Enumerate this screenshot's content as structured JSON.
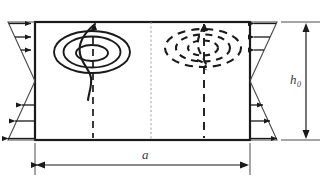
{
  "figure": {
    "type": "technical-diagram",
    "background_color": "#ffffff",
    "stroke_color": "#1a1a1a",
    "thin_stroke_color": "#4a4a4a",
    "centerline_color": "#9a9a9a"
  },
  "labels": {
    "width_label": "a",
    "height_label": "h",
    "height_subscript": "0"
  },
  "dimensions": {
    "width_dimension_name": "a",
    "height_dimension_name": "h0"
  },
  "box": {
    "name": "channel-cross-section",
    "x": 35,
    "y": 22,
    "width": 215,
    "height": 118
  },
  "vortices": [
    {
      "name": "left-vortex",
      "style": "solid",
      "center_x": 92,
      "center_y": 52,
      "rings": 3,
      "axis": "dashed-vertical"
    },
    {
      "name": "right-vortex",
      "style": "dashed",
      "center_x": 203,
      "center_y": 48,
      "rings": 3,
      "axis": "dashed-vertical"
    }
  ],
  "velocity_profiles": {
    "left": {
      "name": "left-velocity-profile",
      "upper_arrow_direction": "right",
      "lower_arrow_direction": "left",
      "arrow_count": 6,
      "zero_crossing_fraction": 0.5
    },
    "right": {
      "name": "right-velocity-profile",
      "upper_arrow_direction": "left",
      "lower_arrow_direction": "right",
      "arrow_count": 6,
      "zero_crossing_fraction": 0.5
    }
  },
  "centerline": {
    "name": "vertical-centerline",
    "x": 151,
    "style": "dotted"
  }
}
